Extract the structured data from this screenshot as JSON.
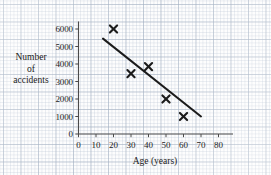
{
  "chart_data": {
    "type": "scatter",
    "title": "",
    "subtitle": "",
    "xlabel": "Age (years)",
    "ylabel_lines": [
      "Number",
      "of",
      "accidents"
    ],
    "ylabel": "Number of accidents",
    "xlim": [
      0,
      80
    ],
    "ylim": [
      0,
      6000
    ],
    "xticks": [
      0,
      10,
      20,
      30,
      40,
      50,
      60,
      70,
      80
    ],
    "yticks": [
      0,
      1000,
      2000,
      3000,
      4000,
      5000,
      6000
    ],
    "xtick_labels": [
      "0",
      "10",
      "20",
      "30",
      "40",
      "50",
      "60",
      "70",
      "80"
    ],
    "ytick_labels": [
      "0",
      "1000",
      "2000",
      "3000",
      "4000",
      "5000",
      "6000"
    ],
    "grid": true,
    "grid_style": "graph-paper",
    "legend": false,
    "marker": "x",
    "series": [
      {
        "name": "accidents-by-age",
        "marker": "x",
        "points": [
          {
            "x": 20,
            "y": 6000
          },
          {
            "x": 30,
            "y": 3450
          },
          {
            "x": 40,
            "y": 3850
          },
          {
            "x": 50,
            "y": 2000
          },
          {
            "x": 60,
            "y": 1000
          }
        ]
      }
    ],
    "trend_line": {
      "name": "line-of-best-fit",
      "x_start": 14,
      "y_start": 5450,
      "x_end": 70,
      "y_end": 1000
    },
    "colors": {
      "ink": "#1b1b1b",
      "axis": "#4a4a4a",
      "grid_major": "#96a5b9",
      "grid_minor": "#afbccd",
      "paper": "#fdfdfd"
    }
  }
}
